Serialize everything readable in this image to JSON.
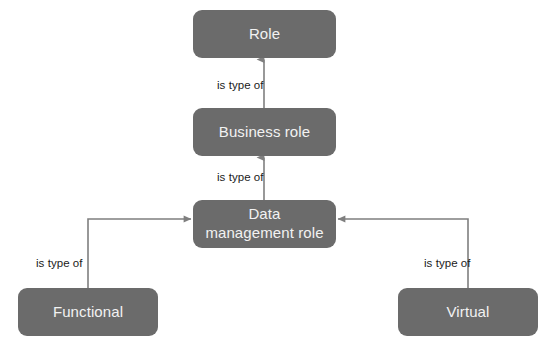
{
  "diagram": {
    "background_color": "#ffffff",
    "node_color": "#6b6b6b",
    "node_text_color": "#f2f2f2",
    "edge_color": "#7f7f7f",
    "edge_label_color": "#1a1a1a",
    "nodes": [
      {
        "id": "role",
        "label": "Role",
        "x": 193,
        "y": 10,
        "w": 143,
        "h": 48
      },
      {
        "id": "business_role",
        "label": "Business role",
        "x": 193,
        "y": 108,
        "w": 143,
        "h": 48
      },
      {
        "id": "data_management_role",
        "label": "Data\nmanagement role",
        "x": 193,
        "y": 200,
        "w": 143,
        "h": 48
      },
      {
        "id": "functional",
        "label": "Functional",
        "x": 18,
        "y": 288,
        "w": 140,
        "h": 48
      },
      {
        "id": "virtual",
        "label": "Virtual",
        "x": 398,
        "y": 288,
        "w": 140,
        "h": 48
      }
    ],
    "edges": [
      {
        "id": "business-to-role",
        "from": "business_role",
        "to": "role",
        "label": "is type of"
      },
      {
        "id": "data-to-business",
        "from": "data_management_role",
        "to": "business_role",
        "label": "is type of"
      },
      {
        "id": "functional-to-data",
        "from": "functional",
        "to": "data_management_role",
        "label": "is type of"
      },
      {
        "id": "virtual-to-data",
        "from": "virtual",
        "to": "data_management_role",
        "label": "is type of"
      }
    ],
    "edge_labels": [
      {
        "id": "label-business-to-role",
        "text": "is type of",
        "x": 217,
        "y": 80
      },
      {
        "id": "label-data-to-business",
        "text": "is type of",
        "x": 217,
        "y": 172
      },
      {
        "id": "label-functional-to-data",
        "text": "is type of",
        "x": 36,
        "y": 258
      },
      {
        "id": "label-virtual-to-data",
        "text": "is type of",
        "x": 424,
        "y": 258
      }
    ]
  }
}
